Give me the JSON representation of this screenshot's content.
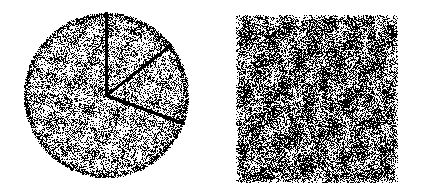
{
  "page": {
    "width": 422,
    "height": 194,
    "background_color": "#ffffff",
    "ink_color": "#000000"
  },
  "figures": [
    {
      "id": "circle-figure",
      "name": "sectored-dot-circle",
      "shape": "circle",
      "center_x": 106,
      "center_y": 95,
      "radius": 82,
      "fill": "random-dot-stipple",
      "dot_density": 0.38,
      "dot_size": 1,
      "rim": {
        "present": true,
        "thickness": 7,
        "density": 0.82
      },
      "sector_lines": [
        {
          "name": "radial-line-up",
          "angle_deg": -90,
          "length": 82,
          "weight": 1.6,
          "darkness": 0.95
        },
        {
          "name": "radial-line-lower-right",
          "angle_deg": 20,
          "length": 82,
          "weight": 1.4,
          "darkness": 0.85
        },
        {
          "name": "radial-line-upper-right",
          "angle_deg": -38,
          "length": 82,
          "weight": 1.2,
          "darkness": 0.45
        }
      ],
      "sector_count": 3
    },
    {
      "id": "square-figure",
      "name": "dense-dot-square",
      "shape": "square",
      "left": 236,
      "top": 15,
      "width": 162,
      "height": 168,
      "fill": "random-dot-stipple",
      "dot_density": 0.58,
      "dot_size": 1,
      "edge": "ragged",
      "sector_lines": [],
      "sector_count": 0
    }
  ],
  "chart_data": {
    "type": "scatter",
    "title": "",
    "xlabel": "",
    "ylabel": "",
    "grid": false,
    "legend": null,
    "note": "Stipple-noise texture figures; no quantitative axes are drawn.",
    "series": [
      {
        "name": "circle-stipple",
        "region": "circle",
        "point_count": 9200,
        "coverage_fraction": 0.38
      },
      {
        "name": "square-stipple",
        "region": "square",
        "point_count": 15800,
        "coverage_fraction": 0.58
      }
    ]
  }
}
